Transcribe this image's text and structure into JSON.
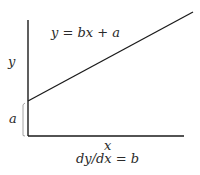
{
  "diagram": {
    "equation": "y = bx + a",
    "y_axis_label": "y",
    "x_axis_label": "x",
    "intercept_label": "a",
    "slope_caption": "dy/dx = b",
    "colors": {
      "stroke": "#1a1a1a",
      "brace": "#9a9a9a",
      "text": "#2a2a2a"
    }
  }
}
